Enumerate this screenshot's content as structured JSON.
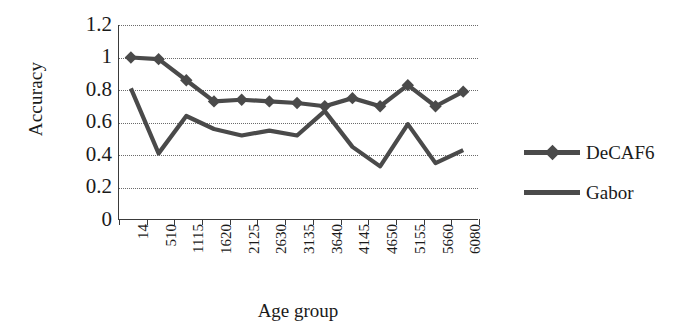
{
  "chart_data": {
    "type": "line",
    "title": "",
    "xlabel": "Age group",
    "ylabel": "Accuracy",
    "categories": [
      "14",
      "510",
      "1115",
      "1620",
      "2125",
      "2630",
      "3135",
      "3640",
      "4145",
      "4650",
      "5155",
      "5660",
      "6080"
    ],
    "yticks": [
      "0",
      "0.2",
      "0.4",
      "0.6",
      "0.8",
      "1",
      "1.2"
    ],
    "ylim": [
      0,
      1.2
    ],
    "grid": true,
    "legend_position": "right",
    "series": [
      {
        "name": "DeCAF6",
        "marker": "diamond",
        "color": "#4a4a4a",
        "values": [
          1.0,
          0.99,
          0.86,
          0.73,
          0.74,
          0.73,
          0.72,
          0.7,
          0.75,
          0.7,
          0.83,
          0.7,
          0.79
        ]
      },
      {
        "name": "Gabor",
        "marker": "none",
        "color": "#4a4a4a",
        "values": [
          0.81,
          0.41,
          0.64,
          0.56,
          0.52,
          0.55,
          0.52,
          0.67,
          0.45,
          0.33,
          0.59,
          0.35,
          0.43
        ]
      }
    ]
  },
  "legend": {
    "items": [
      {
        "label": "DeCAF6"
      },
      {
        "label": "Gabor"
      }
    ]
  },
  "axes": {
    "x_title": "Age group",
    "y_title": "Accuracy"
  }
}
